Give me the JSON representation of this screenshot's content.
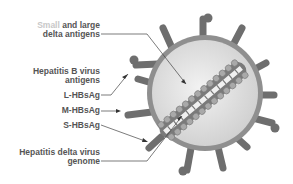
{
  "labels": {
    "delta_antigens_faint": "Small",
    "delta_antigens_rest": " and large",
    "delta_antigens_line2": "delta antigens",
    "hbv_line1": "Hepatitis B virus",
    "hbv_line2": "antigens",
    "l_hbsag": "L-HBsAg",
    "m_hbsag": "M-HBsAg",
    "s_hbsag": "S-HBsAg",
    "genome_line1": "Hepatitis delta virus",
    "genome_line2": "genome"
  },
  "colors": {
    "text": "#555555",
    "faint_text": "#c8c8c8",
    "envelope": "#8a8a8a",
    "interior": "#e4e4e4",
    "spike": "#6e6e6e"
  }
}
